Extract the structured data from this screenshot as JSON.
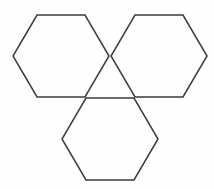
{
  "figure": {
    "title": "Three overlapping hexagons",
    "background_color": "#fefefe",
    "stroke_color": "#3b3b3b",
    "stroke_width": 1.5,
    "canvas": {
      "width": 214,
      "height": 189
    },
    "shape_count": 3,
    "shape_type": "hexagon",
    "orientation": "flat-top",
    "shapes": [
      {
        "name": "top-left-hexagon",
        "label": "Top left hexagon",
        "center": {
          "x": 61,
          "y": 56
        },
        "points": "37,15 85,15 109,56 85,97 37,97 13,56"
      },
      {
        "name": "top-right-hexagon",
        "label": "Top right hexagon",
        "center": {
          "x": 159,
          "y": 56
        },
        "points": "135,15 183,15 207,56 183,97 135,97 111,56"
      },
      {
        "name": "bottom-center-hexagon",
        "label": "Bottom center hexagon",
        "center": {
          "x": 110,
          "y": 139
        },
        "points": "86,98 134,98 158,139 134,180 86,180 62,139"
      }
    ]
  }
}
